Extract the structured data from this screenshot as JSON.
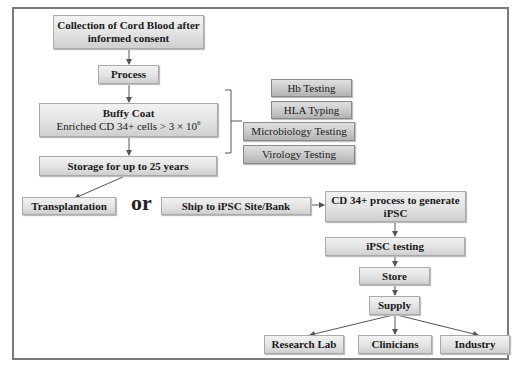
{
  "diagram": {
    "type": "flowchart",
    "nodes": {
      "collection": {
        "line1": "Collection of Cord Blood  after",
        "line2": "informed consent"
      },
      "process": {
        "label": "Process"
      },
      "buffy_coat": {
        "title": "Buffy Coat",
        "subtitle": "Enriched CD 34+ cells > 3 × 10",
        "exponent": "6"
      },
      "storage": {
        "label": "Storage for up to 25 years"
      },
      "transplantation": {
        "label": "Transplantation"
      },
      "or_label": "or",
      "ship": {
        "label": "Ship to iPSC Site/Bank"
      },
      "cd34_process": {
        "line1": "CD 34+ process to generate",
        "line2": "iPSC"
      },
      "ipsc_testing": {
        "label": "iPSC testing"
      },
      "store": {
        "label": "Store"
      },
      "supply": {
        "label": "Supply"
      },
      "research_lab": {
        "label": "Research Lab"
      },
      "clinicians": {
        "label": "Clinicians"
      },
      "industry": {
        "label": "Industry"
      }
    },
    "testing_group": [
      {
        "label": "Hb Testing"
      },
      {
        "label": "HLA Typing"
      },
      {
        "label": "Microbiology Testing"
      },
      {
        "label": "Virology Testing"
      }
    ],
    "edges": [
      [
        "collection",
        "process"
      ],
      [
        "process",
        "buffy_coat"
      ],
      [
        "buffy_coat",
        "storage"
      ],
      [
        "storage",
        "transplantation"
      ],
      [
        "buffy_coat",
        "testing_group"
      ],
      [
        "ship",
        "cd34_process"
      ],
      [
        "cd34_process",
        "ipsc_testing"
      ],
      [
        "ipsc_testing",
        "store"
      ],
      [
        "store",
        "supply"
      ],
      [
        "supply",
        "research_lab"
      ],
      [
        "supply",
        "clinicians"
      ],
      [
        "supply",
        "industry"
      ]
    ],
    "colors": {
      "frame": "#7a7a7a",
      "box_fill": "#e3e3e3",
      "box_dark_fill": "#c9c9c9",
      "arrow": "#555555"
    }
  }
}
